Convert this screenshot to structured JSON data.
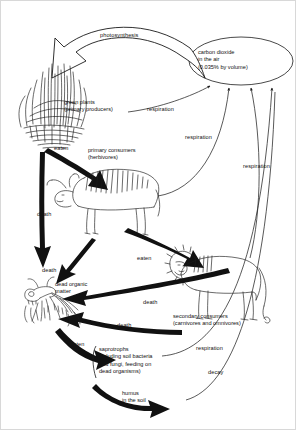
{
  "diagram": {
    "nodes": [
      {
        "id": "carbon-dioxide",
        "lines": [
          "carbon dioxide",
          "in the air",
          "(0.035% by volume)"
        ]
      },
      {
        "id": "green-plants",
        "lines": [
          "green plants",
          "(primary producers)"
        ]
      },
      {
        "id": "primary-consumers",
        "lines": [
          "primary consumers",
          "(herbivores)"
        ]
      },
      {
        "id": "secondary-consumers",
        "lines": [
          "secondary consumers",
          "(carnivores and omnivores)"
        ]
      },
      {
        "id": "dead-organic-matter",
        "lines": [
          "dead organic",
          "matter"
        ]
      },
      {
        "id": "saprotrophs",
        "lines": [
          "saprotrophs",
          "including soil bacteria",
          "and fungi, feeding on",
          "dead organisms)"
        ]
      },
      {
        "id": "humus",
        "lines": [
          "humus",
          "in the soil"
        ]
      }
    ],
    "edges": [
      {
        "id": "photosynthesis",
        "label": "photosynthesis"
      },
      {
        "id": "respiration-plants",
        "label": "respiration"
      },
      {
        "id": "respiration-primary",
        "label": "respiration"
      },
      {
        "id": "respiration-secondary",
        "label": "respiration"
      },
      {
        "id": "respiration-saprotrophs",
        "label": "respiration"
      },
      {
        "id": "eaten-plants-to-primary",
        "label": "eaten"
      },
      {
        "id": "eaten-primary-to-secondary",
        "label": "eaten"
      },
      {
        "id": "eaten-dead-to-saprotrophs",
        "label": "eaten"
      },
      {
        "id": "death-plants",
        "label": "death"
      },
      {
        "id": "death-primary",
        "label": "death"
      },
      {
        "id": "death-secondary-upper",
        "label": "death"
      },
      {
        "id": "death-secondary-lower",
        "label": "death"
      },
      {
        "id": "decay-humus",
        "label": "decay"
      }
    ],
    "colors": {
      "ink": "#111111",
      "thin_stroke": "#222222",
      "background": "#ffffff"
    }
  }
}
